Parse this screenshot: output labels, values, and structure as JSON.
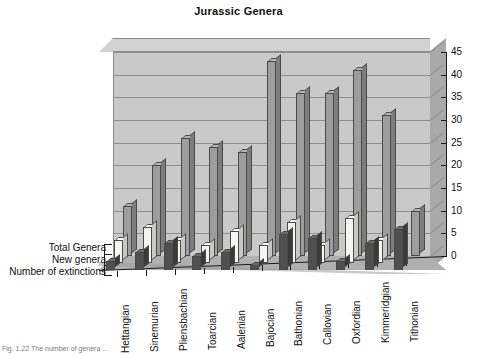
{
  "chart_data": {
    "type": "bar",
    "title": "Jurassic Genera",
    "xlabel": "",
    "ylabel": "",
    "ylim": [
      0,
      45
    ],
    "ytick_step": 5,
    "yticks": [
      45,
      40,
      35,
      30,
      25,
      20,
      15,
      10,
      5,
      0
    ],
    "grid": true,
    "three_d": true,
    "legend_position": "left-axis-labels",
    "categories": [
      "Hettangian",
      "Sinemurian",
      "Pliensbachian",
      "Toarcian",
      "Aalenian",
      "Bajocian",
      "Bathonian",
      "Callovian",
      "Oxfordian",
      "Kimmeridgian",
      "Tithonian"
    ],
    "series": [
      {
        "name": "Total Genera",
        "color": "#9d9d9d",
        "values": [
          11,
          20,
          26,
          24,
          23,
          43,
          36,
          36,
          41,
          31,
          10
        ]
      },
      {
        "name": "New genera",
        "color": "#f5f5f2",
        "values": [
          5,
          8,
          5,
          4,
          7,
          4,
          9,
          4,
          10,
          5,
          0
        ]
      },
      {
        "name": "Number of extinctions",
        "color": "#4f4f4f",
        "values": [
          2,
          4,
          6,
          3,
          4,
          1,
          8,
          7,
          2,
          6,
          9
        ]
      }
    ]
  },
  "caption": "Fig. 1.22  The number of genera ...",
  "legend": {
    "items": [
      "Total Genera",
      "New genera",
      "Number of extinctions"
    ]
  }
}
